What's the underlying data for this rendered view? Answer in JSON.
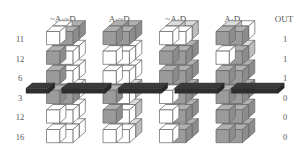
{
  "figure": {
    "title": "",
    "background": "#ffffff",
    "fill_color": "#9b9b9b",
    "fill_color_light": "#c9c9c9",
    "empty_color": "#ffffff",
    "edge_color": "#6b6b6b",
    "band_color": "#3a3a3a",
    "text_color": "#555555"
  },
  "columns": {
    "headers": [
      {
        "label": "~A·~D",
        "name": "col-header-not-a-not-d"
      },
      {
        "label": "A·~D",
        "name": "col-header-a-not-d"
      },
      {
        "label": "~A·D",
        "name": "col-header-not-a-d"
      },
      {
        "label": "A·D",
        "name": "col-header-a-d"
      }
    ],
    "out_header": "OUT"
  },
  "rows": {
    "labels": [
      "11",
      "12",
      "6",
      "3",
      "12",
      "16"
    ],
    "out_values": [
      "1",
      "1",
      "1",
      "0",
      "0",
      "0"
    ]
  },
  "chart_data": {
    "type": "table",
    "title": "",
    "xlabel": "",
    "ylabel": "",
    "categories": [
      "~A·~D",
      "A·~D",
      "~A·D",
      "A·D"
    ],
    "row_labels": [
      "11",
      "12",
      "6",
      "3",
      "12",
      "16"
    ],
    "out": [
      "1",
      "1",
      "1",
      "0",
      "0",
      "0"
    ],
    "threshold_band_after_row_index": 2,
    "legend": [],
    "grid": false,
    "note": "Each cell is a 2x2x1 isometric block of four unit cubes; shaded cube = on, clear cube = off.",
    "cells": [
      {
        "row": 0,
        "col": 0,
        "cubes": [
          0,
          1,
          0,
          1
        ]
      },
      {
        "row": 0,
        "col": 1,
        "cubes": [
          1,
          1,
          1,
          1
        ]
      },
      {
        "row": 0,
        "col": 2,
        "cubes": [
          0,
          0,
          2,
          2
        ]
      },
      {
        "row": 0,
        "col": 3,
        "cubes": [
          1,
          1,
          2,
          0
        ]
      },
      {
        "row": 1,
        "col": 0,
        "cubes": [
          1,
          0,
          1,
          0
        ]
      },
      {
        "row": 1,
        "col": 1,
        "cubes": [
          0,
          0,
          1,
          0
        ]
      },
      {
        "row": 1,
        "col": 2,
        "cubes": [
          1,
          1,
          1,
          1
        ]
      },
      {
        "row": 1,
        "col": 3,
        "cubes": [
          0,
          1,
          0,
          2
        ]
      },
      {
        "row": 2,
        "col": 0,
        "cubes": [
          1,
          0,
          1,
          0
        ]
      },
      {
        "row": 2,
        "col": 1,
        "cubes": [
          0,
          0,
          0,
          0
        ]
      },
      {
        "row": 2,
        "col": 2,
        "cubes": [
          1,
          1,
          1,
          1
        ]
      },
      {
        "row": 2,
        "col": 3,
        "cubes": [
          1,
          1,
          1,
          1
        ]
      },
      {
        "row": 3,
        "col": 0,
        "cubes": [
          1,
          1,
          0,
          0
        ]
      },
      {
        "row": 3,
        "col": 1,
        "cubes": [
          1,
          0,
          1,
          2
        ]
      },
      {
        "row": 3,
        "col": 2,
        "cubes": [
          0,
          1,
          2,
          1
        ]
      },
      {
        "row": 3,
        "col": 3,
        "cubes": [
          1,
          1,
          2,
          1
        ]
      },
      {
        "row": 4,
        "col": 0,
        "cubes": [
          0,
          0,
          0,
          0
        ]
      },
      {
        "row": 4,
        "col": 1,
        "cubes": [
          1,
          0,
          1,
          2
        ]
      },
      {
        "row": 4,
        "col": 2,
        "cubes": [
          0,
          1,
          0,
          1
        ]
      },
      {
        "row": 4,
        "col": 3,
        "cubes": [
          1,
          1,
          1,
          1
        ]
      },
      {
        "row": 5,
        "col": 0,
        "cubes": [
          0,
          0,
          0,
          0
        ]
      },
      {
        "row": 5,
        "col": 1,
        "cubes": [
          0,
          0,
          0,
          2
        ]
      },
      {
        "row": 5,
        "col": 2,
        "cubes": [
          0,
          1,
          0,
          1
        ]
      },
      {
        "row": 5,
        "col": 3,
        "cubes": [
          1,
          1,
          1,
          1
        ]
      }
    ]
  }
}
